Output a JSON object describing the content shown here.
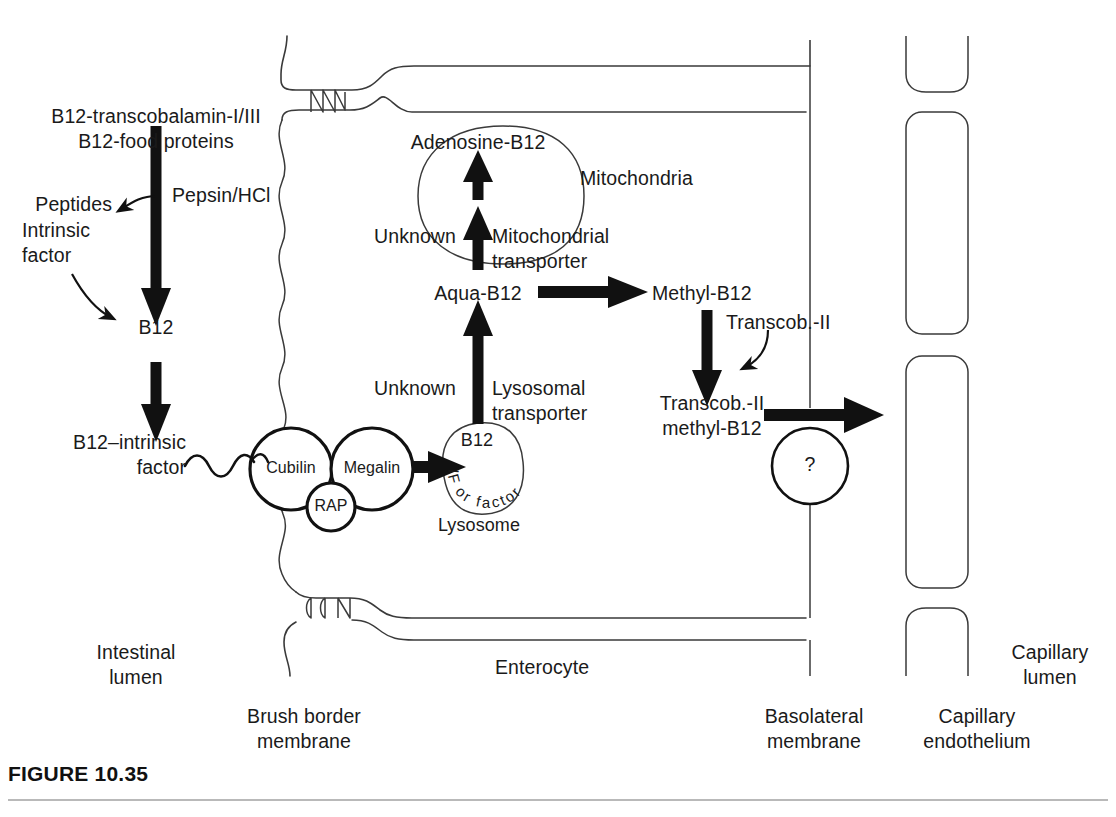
{
  "figure": {
    "caption_label": "FIGURE",
    "caption_number": "10.35"
  },
  "compartments": {
    "intestinal_lumen": "Intestinal\nlumen",
    "enterocyte": "Enterocyte",
    "capillary_lumen": "Capillary\nlumen",
    "brush_border_membrane": "Brush border\nmembrane",
    "basolateral_membrane": "Basolateral\nmembrane",
    "capillary_endothelium": "Capillary\nendothelium"
  },
  "lumen_pathway": {
    "substrate": "B12-transcobalamin-I/III\nB12-food proteins",
    "enzyme": "Pepsin/HCl",
    "byproduct": "Peptides",
    "cofactor": "Intrinsic\nfactor",
    "free_b12": "B12",
    "bound_complex": "B12–intrinsic\nfactor"
  },
  "receptors": {
    "cubilin": "Cubilin",
    "megalin": "Megalin",
    "rap": "RAP"
  },
  "lysosome": {
    "content": "B12",
    "label": "Lysosome",
    "degradation_arc": "IF or factor",
    "arc_chars": [
      "I",
      "F",
      "o",
      "r",
      "f",
      "a",
      "c",
      "t",
      "o",
      "r"
    ]
  },
  "transporters": {
    "lysosomal": "Unknown",
    "lysosomal_name": "Lysosomal\ntransporter",
    "mitochondrial": "Unknown",
    "mitochondrial_name": "Mitochondrial\ntransporter",
    "basolateral_unknown": "?"
  },
  "metabolites": {
    "aqua_b12": "Aqua-B12",
    "adenosine_b12": "Adenosine-B12",
    "methyl_b12": "Methyl-B12",
    "transcob_ii": "Transcob.-II",
    "transcob_methyl": "Transcob.-II\nmethyl-B12"
  },
  "organelles": {
    "mitochondria": "Mitochondria"
  },
  "colors": {
    "ink": "#1a1a1a",
    "outline": "#3a3a3a",
    "rule": "#b9b9b9",
    "paper": "#ffffff"
  }
}
